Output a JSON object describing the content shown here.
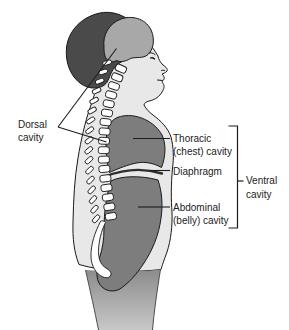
{
  "diagram": {
    "labels": {
      "dorsal": {
        "line1": "Dorsal",
        "line2": "cavity"
      },
      "thoracic": {
        "line1": "Thoracic",
        "line2": "(chest) cavity"
      },
      "diaphragm": {
        "line1": "Diaphragm"
      },
      "abdominal": {
        "line1": "Abdominal",
        "line2": "(belly) cavity"
      },
      "ventral": {
        "line1": "Ventral",
        "line2": "cavity"
      }
    },
    "colors": {
      "background": "#ffffff",
      "body": "#e8e8e8",
      "outline": "#1a1a1a",
      "text": "#1c1c1c",
      "hair": "#4a4a4a",
      "cranial_cavity": "#a8a8a8",
      "ventral_cavity": "#7d7d7d",
      "spinal_canal": "#9a9a9a",
      "vertebrae": "#ffffff",
      "diaphragm_line": "#2e2e2e",
      "leg_top": "#8a8a8a",
      "leg_bottom": "#c8c8c8"
    }
  }
}
